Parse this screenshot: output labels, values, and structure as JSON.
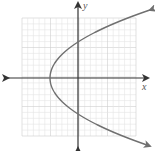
{
  "chart_data": {
    "type": "line",
    "title": "",
    "xlabel": "x",
    "ylabel": "y",
    "grid": true,
    "legend": "none",
    "tick_labels": "none",
    "series": [
      {
        "name": "parabola",
        "description": "Sideways parabola opening right, symmetric about the x-axis, vertex left of the origin",
        "color": "#707070"
      }
    ]
  },
  "layout_px": {
    "grid": {
      "left": 22,
      "top": 18,
      "right": 136,
      "bottom": 136,
      "cells_per_side_estimate": 20
    },
    "origin": {
      "x": 78,
      "y": 78
    },
    "axis_x": {
      "from": 8,
      "to": 148
    },
    "axis_y": {
      "from": 3,
      "to": 148
    },
    "curve": {
      "vertex": {
        "x": 50,
        "y": 78
      },
      "upper_y_intercept": {
        "x": 78,
        "y": 42
      },
      "lower_y_intercept": {
        "x": 78,
        "y": 114
      },
      "upper_end": {
        "x": 122,
        "y": 10
      },
      "lower_end": {
        "x": 136,
        "y": 146
      }
    }
  },
  "labels": {
    "x_axis": "x",
    "y_axis": "y"
  },
  "colors": {
    "grid_minor": "#e4e4e4",
    "grid_major": "#cfcfcf",
    "axis": "#333333",
    "curve": "#707070"
  }
}
